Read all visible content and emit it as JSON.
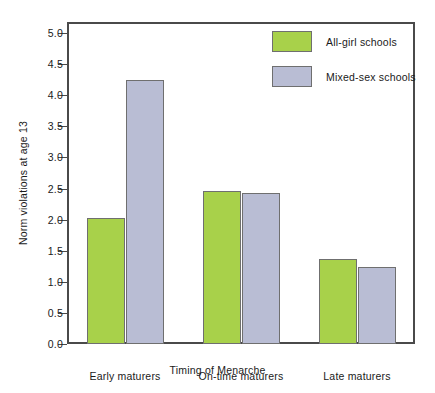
{
  "chart_data": {
    "type": "bar",
    "title": "",
    "subtitle": "",
    "xlabel": "Timing of Menarche",
    "ylabel": "Norm violations at age 13",
    "categories": [
      "Early maturers",
      "On-time maturers",
      "Late maturers"
    ],
    "series": [
      {
        "name": "All-girl schools",
        "color": "#a8d14a",
        "values": [
          2.02,
          2.46,
          1.37
        ]
      },
      {
        "name": "Mixed-sex schools",
        "color": "#b9bdd4",
        "values": [
          4.24,
          2.42,
          1.24
        ]
      }
    ],
    "ylim": [
      0.0,
      5.0
    ],
    "ytick_values": [
      0.0,
      0.5,
      1.0,
      1.5,
      2.0,
      2.5,
      3.0,
      3.5,
      4.0,
      4.5,
      5.0
    ],
    "ytick_labels": [
      "0.0",
      "0.5",
      "1.0",
      "1.5",
      "2.0",
      "2.5",
      "3.0",
      "3.5",
      "4.0",
      "4.5",
      "5.0"
    ],
    "grid": false,
    "legend_position": "top-right",
    "bar_edge_color": "#6f6f6f",
    "axis_color": "#4a4a4a",
    "background": "#ffffff"
  },
  "legend": {
    "entries": [
      {
        "label": "All-girl schools",
        "swatch": "#a8d14a"
      },
      {
        "label": "Mixed-sex schools",
        "swatch": "#b9bdd4"
      }
    ]
  }
}
